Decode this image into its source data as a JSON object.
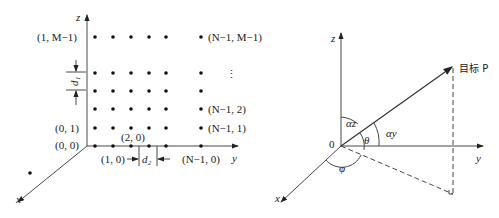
{
  "left_panel": {
    "axes": {
      "z": "z",
      "y": "y",
      "x": "x"
    },
    "grid_labels": {
      "top_left": "(1, M−1)",
      "top_right": "(N−1, M−1)",
      "vdots": "⋮",
      "row2_right": "(N−1, 2)",
      "row1_left": "(0, 1)",
      "row1_right": "(N−1, 1)",
      "origin": "(0, 0)",
      "pt_2_0": "(2, 0)",
      "pt_1_0": "(1, 0)",
      "pt_n_0": "(N−1, 0)"
    },
    "spacing": {
      "d1": "d₁",
      "d2": "d₂"
    }
  },
  "right_panel": {
    "axes": {
      "z": "z",
      "y": "y",
      "x": "x"
    },
    "origin": "0",
    "target": "目标 P",
    "angles": {
      "alpha_z": "αz",
      "alpha_y": "αy",
      "theta": "θ",
      "phi": "φ"
    }
  }
}
